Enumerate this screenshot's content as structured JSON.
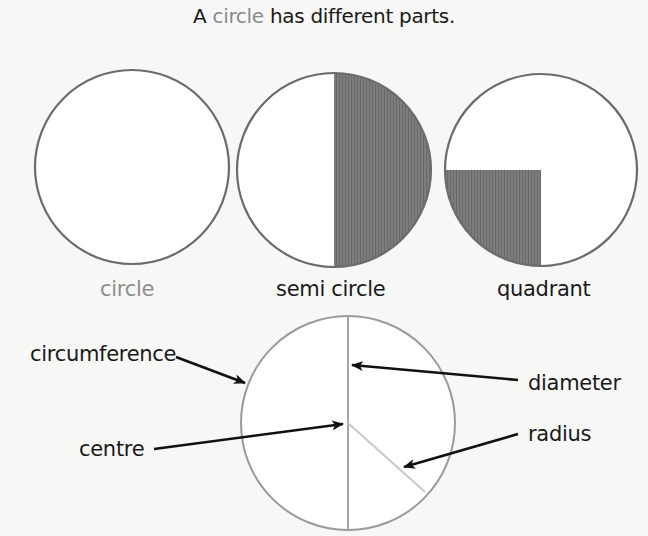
{
  "title": {
    "prefix": "A ",
    "highlight": "circle",
    "suffix": " has different parts."
  },
  "shapes": [
    {
      "label": "circle",
      "fill": "none"
    },
    {
      "label": "semi circle",
      "fill": "right-half"
    },
    {
      "label": "quadrant",
      "fill": "bottom-left-quarter"
    }
  ],
  "annotations": {
    "circumference": "circumference",
    "diameter": "diameter",
    "centre": "centre",
    "radius": "radius"
  },
  "colors": {
    "outline": "#6b6b6b",
    "shade": "#7a7a7a",
    "title_highlight": "#8a8a8a",
    "parts_outline": "#9a9a9a",
    "radius_line": "#c4c4c4",
    "arrow": "#111111"
  }
}
